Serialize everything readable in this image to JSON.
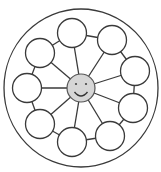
{
  "diagram": {
    "type": "hub-and-spoke wheel",
    "outer_ring": {
      "cx": 81,
      "cy": 88,
      "rx": 77,
      "ry": 79
    },
    "hub": {
      "cx": 81,
      "cy": 88,
      "r": 14,
      "fill": "#d6d6d6",
      "icon": "smiley-face"
    },
    "node_radius": 14.5,
    "nodes": [
      {
        "id": "top",
        "cx": 72,
        "cy": 33,
        "label": ""
      },
      {
        "id": "top-right",
        "cx": 112,
        "cy": 40,
        "label": ""
      },
      {
        "id": "right-upper",
        "cx": 135,
        "cy": 71,
        "label": ""
      },
      {
        "id": "right-lower",
        "cx": 133,
        "cy": 108,
        "label": ""
      },
      {
        "id": "bottom-right",
        "cx": 110,
        "cy": 136,
        "label": ""
      },
      {
        "id": "bottom",
        "cx": 72,
        "cy": 142,
        "label": ""
      },
      {
        "id": "bottom-left",
        "cx": 40,
        "cy": 124,
        "label": ""
      },
      {
        "id": "left",
        "cx": 27,
        "cy": 88,
        "label": ""
      },
      {
        "id": "upper-left",
        "cx": 40,
        "cy": 53,
        "label": ""
      }
    ]
  }
}
